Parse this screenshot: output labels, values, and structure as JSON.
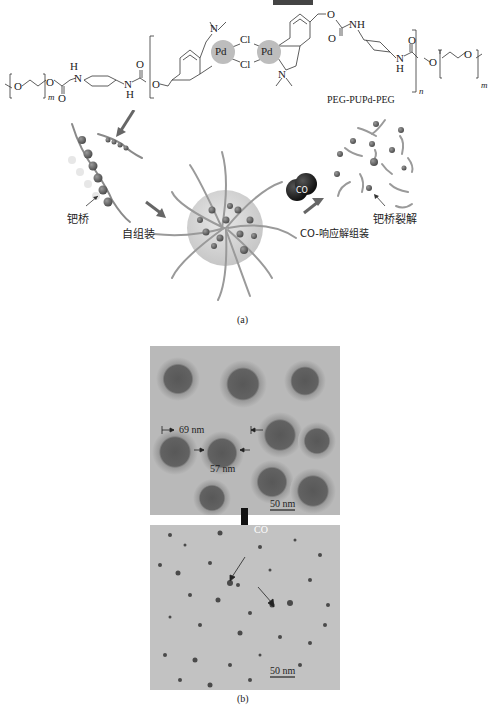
{
  "figure": {
    "part_a": {
      "caption": "(a)",
      "polymer_name": "PEG-PUPd-PEG",
      "atoms": {
        "pd_left": "Pd",
        "pd_right": "Pd",
        "cl_top": "Cl",
        "cl_bottom": "Cl",
        "n_top": "N",
        "n_bottom": "N",
        "o": "O",
        "nh": "NH",
        "h": "H"
      },
      "subscripts": {
        "m": "m",
        "n": "n"
      },
      "labels": {
        "pd_bridge": "钯桥",
        "self_assembly": "自组装",
        "co_disassembly": "CO-响应解组装",
        "bridge_cleavage": "钯桥裂解",
        "co_molecule": "CO"
      }
    },
    "part_b": {
      "caption": "(b)",
      "top_image": {
        "outer_diameter": "69 nm",
        "core_diameter": "57 nm",
        "scale_bar": "50 nm"
      },
      "arrow_label": "CO",
      "bottom_image": {
        "scale_bar": "50 nm"
      }
    },
    "colors": {
      "pd_circle": "#bdbdbd",
      "bead": "#6e6e6e",
      "micelle_core": "#d4d4d4",
      "tem_bg": "#b9b9b9",
      "particle_core": "#5d5d5d",
      "particle_halo": "#9a9a9a",
      "co_molecule": "#2b2b2b"
    }
  }
}
